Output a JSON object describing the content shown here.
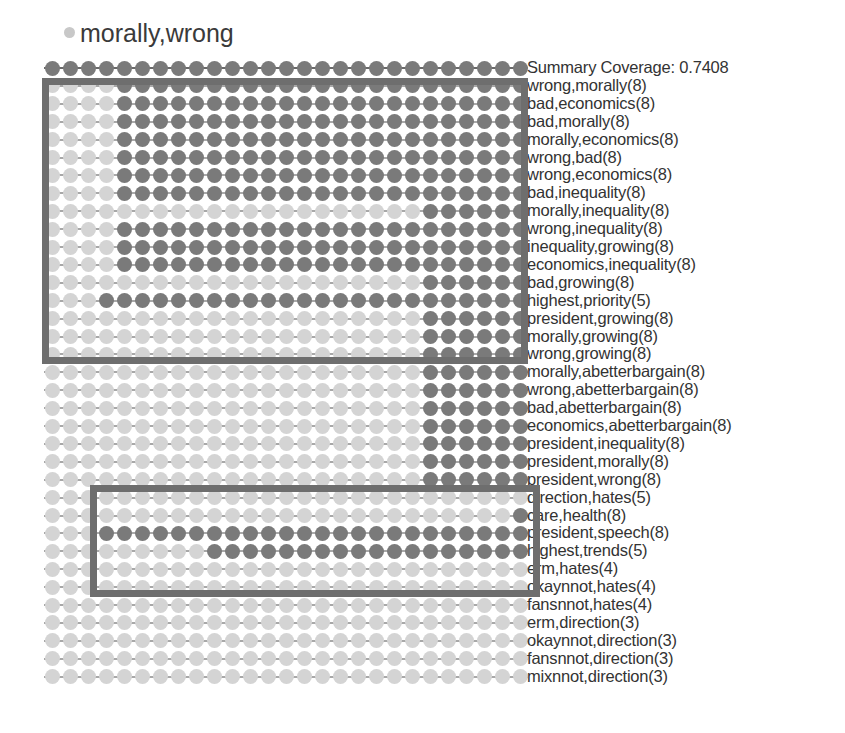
{
  "title": {
    "text": "morally,wrong",
    "dot_color": "#c8c8c8"
  },
  "colors": {
    "dark": "#7a7a7a",
    "light": "#d4d4d4",
    "line_dark": "#6a6a6a",
    "line_light": "#a8a8a8",
    "box": "#6e6e6e"
  },
  "grid": {
    "columns": 27,
    "x0": 52,
    "dx": 18,
    "y0": 68,
    "dy": 17.9
  },
  "summary": {
    "label": "Summary Coverage: 0.7408"
  },
  "rows": [
    {
      "label": "Summary Coverage: 0.7408",
      "pattern": "DDDDDDDDDDDDDDDDDDDDDDDDDDD"
    },
    {
      "label": "wrong,morally(8)",
      "pattern": "LLLLDDDDDDDDDDDDDDDDDDDDDDD"
    },
    {
      "label": "bad,economics(8)",
      "pattern": "LLLLDDDDDDDDDDDDDDDDDDDDDDD"
    },
    {
      "label": "bad,morally(8)",
      "pattern": "LLLLDDDDDDDDDDDDDDDDDDDDDDD"
    },
    {
      "label": "morally,economics(8)",
      "pattern": "LLLLDDDDDDDDDDDDDDDDDDDDDDD"
    },
    {
      "label": "wrong,bad(8)",
      "pattern": "LLLLDDDDDDDDDDDDDDDDDDDDDDD"
    },
    {
      "label": "wrong,economics(8)",
      "pattern": "LLLLDDDDDDDDDDDDDDDDDDDDDDD"
    },
    {
      "label": "bad,inequality(8)",
      "pattern": "LLLLDDDDDDDDDDDDDDDDDDDDDDD"
    },
    {
      "label": "morally,inequality(8)",
      "pattern": "LLLLLLLLLLLLLLLLLLLLLDDDDDD"
    },
    {
      "label": "wrong,inequality(8)",
      "pattern": "LLLLDDDDDDDDDDDDDDDDDDDDDDD"
    },
    {
      "label": "inequality,growing(8)",
      "pattern": "LLLLDDDDDDDDDDDDDDDDDDDDDDD"
    },
    {
      "label": "economics,inequality(8)",
      "pattern": "LLLLDDDDDDDDDDDDDDDDDDDDDDD"
    },
    {
      "label": "bad,growing(8)",
      "pattern": "LLLLLLLLLLLLLLLLLLLLLDDDDDD"
    },
    {
      "label": "highest,priority(5)",
      "pattern": "LLLDDDDDDDDDDDDDDDDDDDDDDDD"
    },
    {
      "label": "president,growing(8)",
      "pattern": "LLLLLLLLLLLLLLLLLLLLLDDDDDD"
    },
    {
      "label": "morally,growing(8)",
      "pattern": "LLLLLLLLLLLLLLLLLLLLLDDDDDD"
    },
    {
      "label": "wrong,growing(8)",
      "pattern": "LLLLLLLLLLLLLLLLLLLLLDDDDDD"
    },
    {
      "label": "morally,abetterbargain(8)",
      "pattern": "LLLLLLLLLLLLLLLLLLLLLDDDDDD"
    },
    {
      "label": "wrong,abetterbargain(8)",
      "pattern": "LLLLLLLLLLLLLLLLLLLLLDDDDDD"
    },
    {
      "label": "bad,abetterbargain(8)",
      "pattern": "LLLLLLLLLLLLLLLLLLLLLDDDDDD"
    },
    {
      "label": "economics,abetterbargain(8)",
      "pattern": "LLLLLLLLLLLLLLLLLLLLLDDDDDD"
    },
    {
      "label": "president,inequality(8)",
      "pattern": "LLLLLLLLLLLLLLLLLLLLLDDDDDD"
    },
    {
      "label": "president,morally(8)",
      "pattern": "LLLLLLLLLLLLLLLLLLLLLDDDDDD"
    },
    {
      "label": "president,wrong(8)",
      "pattern": "LLLLLLLLLLLLLLLLLLLLLDDDDDD"
    },
    {
      "label": "direction,hates(5)",
      "pattern": "LLLLLLLLLLLLLLLLLLLLLLLLLLL"
    },
    {
      "label": "care,health(8)",
      "pattern": "LLLLLLLLLLLLLLLLLLLLLLLLLLD"
    },
    {
      "label": "president,speech(8)",
      "pattern": "LLLDDDDDDDDDDDDDDDDDDDDDDDD"
    },
    {
      "label": "highest,trends(5)",
      "pattern": "LLLLLLLLLDDDDDDDDDDDDDDDDDD"
    },
    {
      "label": "erm,hates(4)",
      "pattern": "LLLLLLLLLLLLLLLLLLLLLLLLLLL"
    },
    {
      "label": "okaynnot,hates(4)",
      "pattern": "LLLLLLLLLLLLLLLLLLLLLLLLLLL"
    },
    {
      "label": "fansnnot,hates(4)",
      "pattern": "LLLLLLLLLLLLLLLLLLLLLLLLLLL"
    },
    {
      "label": "erm,direction(3)",
      "pattern": "LLLLLLLLLLLLLLLLLLLLLLLLLLL"
    },
    {
      "label": "okaynnot,direction(3)",
      "pattern": "LLLLLLLLLLLLLLLLLLLLLLLLLLL"
    },
    {
      "label": "fansnnot,direction(3)",
      "pattern": "LLLLLLLLLLLLLLLLLLLLLLLLLLL"
    },
    {
      "label": "mixnnot,direction(3)",
      "pattern": "LLLLLLLLLLLLLLLLLLLLLLLLLLL"
    }
  ],
  "boxes": [
    {
      "name": "top-cluster-box",
      "left": 42,
      "top": 78,
      "width": 486,
      "height": 286
    },
    {
      "name": "bottom-cluster-box",
      "left": 90,
      "top": 485,
      "width": 450,
      "height": 112
    }
  ]
}
